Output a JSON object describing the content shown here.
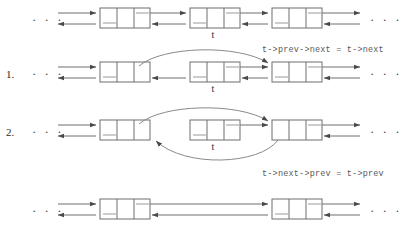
{
  "diagram": {
    "colors": {
      "background": "#ffffff",
      "line": "#6e6e6e",
      "curve": "#8a8a8a",
      "arrowhead": "#4a4a4a",
      "text": "#2b2b2b",
      "code_text": "#5a5a5a"
    },
    "ellipsis": "· · ·",
    "node_label": "t",
    "rows": [
      {
        "id": "row-initial",
        "step_number": "",
        "caption": "",
        "node_count": 3,
        "target_label": "t",
        "target_index": 1,
        "curves": []
      },
      {
        "id": "row-step-1",
        "step_number": "1.",
        "caption": "t->prev->next = t->next",
        "node_count": 3,
        "target_label": "t",
        "target_index": 1,
        "curves": [
          "prev-next-over"
        ]
      },
      {
        "id": "row-step-2",
        "step_number": "2.",
        "caption": "t->next->prev = t->prev",
        "node_count": 3,
        "target_label": "t",
        "target_index": 1,
        "curves": [
          "prev-next-over",
          "next-prev-under"
        ]
      },
      {
        "id": "row-final",
        "step_number": "",
        "caption": "",
        "node_count": 2,
        "target_label": "",
        "target_index": -1,
        "curves": []
      }
    ],
    "captions": {
      "step1": "t->prev->next = t->next",
      "step2": "t->next->prev = t->prev"
    },
    "step_numbers": {
      "one": "1.",
      "two": "2."
    }
  }
}
